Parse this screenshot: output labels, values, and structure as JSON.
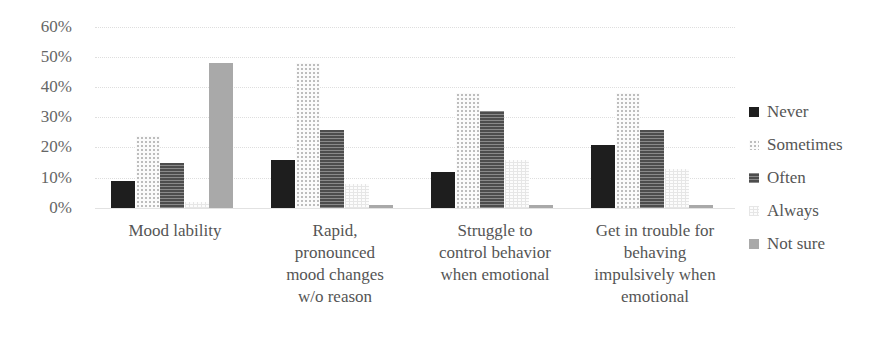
{
  "chart_data": {
    "type": "bar",
    "title": "",
    "xlabel": "",
    "ylabel": "",
    "ylim": [
      0,
      60
    ],
    "yticks": [
      "0%",
      "10%",
      "20%",
      "30%",
      "40%",
      "50%",
      "60%"
    ],
    "grid": true,
    "legend_position": "right",
    "categories": [
      "Mood lability",
      "Rapid, pronounced mood changes w/o reason",
      "Struggle to control behavior when emotional",
      "Get in trouble for behaving impulsively when emotional"
    ],
    "series": [
      {
        "name": "Never",
        "values": [
          9,
          16,
          12,
          21
        ]
      },
      {
        "name": "Sometimes",
        "values": [
          24,
          48,
          38,
          38
        ]
      },
      {
        "name": "Often",
        "values": [
          15,
          26,
          32,
          26
        ]
      },
      {
        "name": "Always",
        "values": [
          2,
          8,
          16,
          13
        ]
      },
      {
        "name": "Not sure",
        "values": [
          48,
          1,
          1,
          1
        ]
      }
    ]
  },
  "axis": {
    "yticks": [
      "60%",
      "50%",
      "40%",
      "30%",
      "20%",
      "10%",
      "0%"
    ]
  },
  "categories_lines": [
    [
      "Mood lability"
    ],
    [
      "Rapid,",
      "pronounced",
      "mood changes",
      "w/o reason"
    ],
    [
      "Struggle to",
      "control behavior",
      "when emotional"
    ],
    [
      "Get in trouble for",
      "behaving",
      "impulsively when",
      "emotional"
    ]
  ],
  "legend": [
    "Never",
    "Sometimes",
    "Often",
    "Always",
    "Not sure"
  ]
}
